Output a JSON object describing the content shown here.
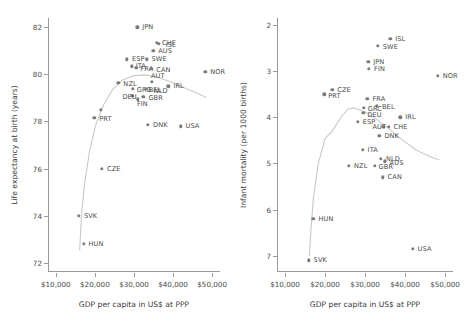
{
  "colors": {
    "dot": "#7b7b7b",
    "curve": "#c9c9c9",
    "axis": "#9a9a9a",
    "text": "#4a4a4a",
    "background": "#ffffff"
  },
  "xaxis": {
    "label": "GDP per capita in US$ at PPP",
    "ticks": [
      "$10,000",
      "$20,000",
      "$30,000",
      "$40,000",
      "$50,000"
    ],
    "tick_values": [
      10000,
      20000,
      30000,
      40000,
      50000
    ],
    "range": [
      8000,
      52000
    ]
  },
  "chart_data": [
    {
      "type": "scatter",
      "id": "life-expectancy",
      "title": "",
      "xlabel": "GDP per capita in US$ at PPP",
      "ylabel": "Life expectancy at birth (years)",
      "xlim": [
        8000,
        52000
      ],
      "ylim": [
        71.6,
        82.4
      ],
      "yticks": [
        72,
        74,
        76,
        78,
        80,
        82
      ],
      "ytick_labels": [
        "72",
        "74",
        "76",
        "78",
        "80",
        "82"
      ],
      "y_inverted": false,
      "grid": false,
      "legend": "none",
      "points": [
        {
          "label": "JPN",
          "x": 30800,
          "y": 82.0,
          "lx": 4,
          "ly": 0
        },
        {
          "label": "CHE",
          "x": 35900,
          "y": 81.35,
          "lx": 4,
          "ly": 0
        },
        {
          "label": "ISL",
          "x": 36300,
          "y": 81.3,
          "lx": 6,
          "ly": 1
        },
        {
          "label": "AUS",
          "x": 34900,
          "y": 81.0,
          "lx": 4,
          "ly": 0
        },
        {
          "label": "ESP",
          "x": 28200,
          "y": 80.65,
          "lx": 4,
          "ly": 0
        },
        {
          "label": "SWE",
          "x": 33200,
          "y": 80.65,
          "lx": 4,
          "ly": 0
        },
        {
          "label": "ITA",
          "x": 29400,
          "y": 80.35,
          "lx": 3,
          "ly": 0
        },
        {
          "label": "FRA",
          "x": 30600,
          "y": 80.28,
          "lx": 3,
          "ly": 1
        },
        {
          "label": "CAN",
          "x": 34400,
          "y": 80.25,
          "lx": 4,
          "ly": 1
        },
        {
          "label": "NOR",
          "x": 48200,
          "y": 80.1,
          "lx": 4,
          "ly": 0
        },
        {
          "label": "AUT",
          "x": 34600,
          "y": 79.7,
          "lx": -2,
          "ly": -6
        },
        {
          "label": "NZL",
          "x": 26000,
          "y": 79.65,
          "lx": 4,
          "ly": 1
        },
        {
          "label": "IRL",
          "x": 38800,
          "y": 79.5,
          "lx": 4,
          "ly": 0
        },
        {
          "label": "GRC",
          "x": 29700,
          "y": 79.4,
          "lx": 3,
          "ly": 1
        },
        {
          "label": "BEL",
          "x": 33000,
          "y": 79.4,
          "lx": 2,
          "ly": 1
        },
        {
          "label": "NLD",
          "x": 34000,
          "y": 79.35,
          "lx": 3,
          "ly": 1
        },
        {
          "label": "DEU",
          "x": 29600,
          "y": 79.1,
          "lx": -11,
          "ly": 1
        },
        {
          "label": "GBR",
          "x": 32400,
          "y": 79.05,
          "lx": 4,
          "ly": 1
        },
        {
          "label": "FIN",
          "x": 31000,
          "y": 78.95,
          "lx": -2,
          "ly": 5
        },
        {
          "label": "",
          "x": 21500,
          "y": 78.5,
          "lx": 0,
          "ly": 0
        },
        {
          "label": "PRT",
          "x": 19800,
          "y": 78.15,
          "lx": 4,
          "ly": 1
        },
        {
          "label": "DNK",
          "x": 33600,
          "y": 77.85,
          "lx": 4,
          "ly": 0
        },
        {
          "label": "USA",
          "x": 41900,
          "y": 77.8,
          "lx": 4,
          "ly": 0
        },
        {
          "label": "CZE",
          "x": 21800,
          "y": 76.0,
          "lx": 4,
          "ly": 0
        },
        {
          "label": "SVK",
          "x": 15900,
          "y": 74.0,
          "lx": 4,
          "ly": 0
        },
        {
          "label": "HUN",
          "x": 17100,
          "y": 72.8,
          "lx": 4,
          "ly": 0
        }
      ],
      "curve": [
        [
          16100,
          72.55
        ],
        [
          16600,
          74.1
        ],
        [
          17400,
          75.4
        ],
        [
          18600,
          76.7
        ],
        [
          20200,
          77.85
        ],
        [
          22200,
          78.7
        ],
        [
          24500,
          79.35
        ],
        [
          27000,
          79.75
        ],
        [
          30000,
          79.95
        ],
        [
          33000,
          79.98
        ],
        [
          36000,
          79.88
        ],
        [
          39500,
          79.68
        ],
        [
          43000,
          79.42
        ],
        [
          46500,
          79.18
        ],
        [
          48500,
          79.02
        ]
      ]
    },
    {
      "type": "scatter",
      "id": "infant-mortality",
      "title": "",
      "xlabel": "GDP per capita in US$ at PPP",
      "ylabel": "Infant mortality (per 1000 births)",
      "xlim": [
        8000,
        52000
      ],
      "ylim": [
        1.85,
        7.35
      ],
      "yticks": [
        2,
        3,
        4,
        5,
        6,
        7
      ],
      "ytick_labels": [
        "2",
        "3",
        "4",
        "5",
        "6",
        "7"
      ],
      "y_inverted": true,
      "grid": false,
      "legend": "none",
      "points": [
        {
          "label": "ISL",
          "x": 36300,
          "y": 2.3,
          "lx": 4,
          "ly": 0
        },
        {
          "label": "SWE",
          "x": 33200,
          "y": 2.45,
          "lx": 4,
          "ly": 1
        },
        {
          "label": "JPN",
          "x": 30800,
          "y": 2.8,
          "lx": 4,
          "ly": 0
        },
        {
          "label": "FIN",
          "x": 31000,
          "y": 2.95,
          "lx": 4,
          "ly": 0
        },
        {
          "label": "NOR",
          "x": 48200,
          "y": 3.1,
          "lx": 4,
          "ly": 0
        },
        {
          "label": "CZE",
          "x": 21800,
          "y": 3.4,
          "lx": 4,
          "ly": 0
        },
        {
          "label": "PRT",
          "x": 19800,
          "y": 3.5,
          "lx": 3,
          "ly": 2
        },
        {
          "label": "FRA",
          "x": 30600,
          "y": 3.6,
          "lx": 4,
          "ly": 0
        },
        {
          "label": "BEL",
          "x": 33000,
          "y": 3.75,
          "lx": 4,
          "ly": 1
        },
        {
          "label": "GRC",
          "x": 29700,
          "y": 3.8,
          "lx": 3,
          "ly": 1
        },
        {
          "label": "DEU",
          "x": 29600,
          "y": 3.9,
          "lx": 3,
          "ly": 2
        },
        {
          "label": "IRL",
          "x": 38800,
          "y": 4.0,
          "lx": 4,
          "ly": 0
        },
        {
          "label": "ESP",
          "x": 28200,
          "y": 4.1,
          "lx": 4,
          "ly": 0
        },
        {
          "label": "AUT",
          "x": 34600,
          "y": 4.2,
          "lx": -12,
          "ly": 0
        },
        {
          "label": "CHE",
          "x": 35900,
          "y": 4.2,
          "lx": 4,
          "ly": 0
        },
        {
          "label": "DNK",
          "x": 33600,
          "y": 4.4,
          "lx": 4,
          "ly": 0
        },
        {
          "label": "ITA",
          "x": 29400,
          "y": 4.7,
          "lx": 4,
          "ly": 0
        },
        {
          "label": "NLD",
          "x": 34000,
          "y": 4.9,
          "lx": 4,
          "ly": 0
        },
        {
          "label": "AUS",
          "x": 34900,
          "y": 4.95,
          "lx": 4,
          "ly": 2
        },
        {
          "label": "NZL",
          "x": 26000,
          "y": 5.05,
          "lx": 4,
          "ly": 0
        },
        {
          "label": "GBR",
          "x": 32400,
          "y": 5.05,
          "lx": 3,
          "ly": 1
        },
        {
          "label": "CAN",
          "x": 34400,
          "y": 5.3,
          "lx": 4,
          "ly": 0
        },
        {
          "label": "HUN",
          "x": 17100,
          "y": 6.2,
          "lx": 4,
          "ly": 0
        },
        {
          "label": "USA",
          "x": 41900,
          "y": 6.85,
          "lx": 4,
          "ly": 0
        },
        {
          "label": "SVK",
          "x": 15900,
          "y": 7.1,
          "lx": 4,
          "ly": 0
        }
      ],
      "curve": [
        [
          16100,
          7.0
        ],
        [
          16500,
          6.4
        ],
        [
          17100,
          5.75
        ],
        [
          18300,
          5.0
        ],
        [
          20100,
          4.45
        ],
        [
          21800,
          4.3
        ],
        [
          24000,
          4.0
        ],
        [
          25700,
          3.82
        ],
        [
          27200,
          3.8
        ],
        [
          30000,
          3.88
        ],
        [
          33000,
          4.05
        ],
        [
          36000,
          4.25
        ],
        [
          39500,
          4.5
        ],
        [
          43000,
          4.72
        ],
        [
          46500,
          4.86
        ],
        [
          48500,
          4.92
        ]
      ]
    }
  ]
}
